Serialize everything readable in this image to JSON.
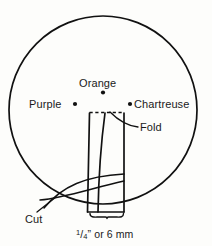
{
  "figure": {
    "background_color": "#fdfdfb",
    "ink_color": "#111111"
  },
  "labels": {
    "orange": "Orange",
    "purple": "Purple",
    "chartreuse": "Chartreuse",
    "fold": "Fold",
    "cut": "Cut",
    "measure_numerator": "1",
    "measure_slash": "/",
    "measure_denominator": "4",
    "measure_prime": "”",
    "measure_rest": " or 6 mm"
  },
  "geometry": {
    "circle": {
      "cx": 103,
      "cy": 110,
      "r": 94,
      "stroke_width": 1.7
    },
    "strip": {
      "left": 88,
      "right": 124,
      "top": 113,
      "bottom": 212
    },
    "fold_line_y": 112,
    "points": {
      "orange": {
        "x": 103,
        "y": 92
      },
      "purple": {
        "x": 75,
        "y": 104
      },
      "chartreuse": {
        "x": 130,
        "y": 104
      }
    },
    "bracket": {
      "left": 90,
      "right": 123,
      "y": 216
    }
  }
}
